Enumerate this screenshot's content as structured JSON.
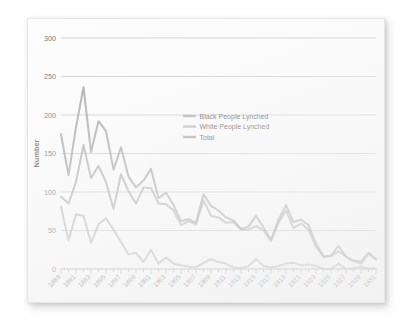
{
  "chart_data": {
    "type": "line",
    "title": "",
    "xlabel": "",
    "ylabel": "Number",
    "ylim": [
      0,
      300
    ],
    "xlim": [
      1889,
      1931
    ],
    "yticks": [
      0,
      50,
      100,
      150,
      200,
      250,
      300
    ],
    "grid": true,
    "legend_position": "center",
    "x": [
      1889,
      1890,
      1891,
      1892,
      1893,
      1894,
      1895,
      1896,
      1897,
      1898,
      1899,
      1900,
      1901,
      1902,
      1903,
      1904,
      1905,
      1906,
      1907,
      1908,
      1909,
      1910,
      1911,
      1912,
      1913,
      1914,
      1915,
      1916,
      1917,
      1918,
      1919,
      1920,
      1921,
      1922,
      1923,
      1924,
      1925,
      1926,
      1927,
      1928,
      1929,
      1930,
      1931
    ],
    "xticklabels": [
      "1889",
      "1891",
      "1893",
      "1895",
      "1897",
      "1899",
      "1901",
      "1903",
      "1905",
      "1907",
      "1909",
      "1911",
      "1913",
      "1915",
      "1917",
      "1919",
      "1921",
      "1923",
      "1925",
      "1927",
      "1929",
      "1931"
    ],
    "series": [
      {
        "name": "Black People Lynched",
        "color": "#9a9a9a",
        "values": [
          94,
          85,
          113,
          161,
          118,
          134,
          113,
          78,
          123,
          101,
          85,
          106,
          105,
          85,
          84,
          76,
          57,
          62,
          58,
          89,
          69,
          67,
          60,
          61,
          51,
          51,
          56,
          50,
          36,
          60,
          76,
          53,
          59,
          51,
          29,
          16,
          17,
          23,
          16,
          10,
          7,
          20,
          12
        ],
        "notes": "upper grey line; converges with Total after ~1905"
      },
      {
        "name": "White People Lynched",
        "color": "#a6a6a6",
        "values": [
          81,
          37,
          71,
          69,
          34,
          58,
          66,
          51,
          35,
          19,
          21,
          9,
          25,
          7,
          15,
          7,
          5,
          3,
          2,
          8,
          13,
          9,
          7,
          2,
          1,
          4,
          13,
          4,
          2,
          4,
          7,
          8,
          5,
          6,
          4,
          0,
          0,
          7,
          0,
          1,
          3,
          1,
          1
        ],
        "notes": "lower grey line near baseline after ~1905"
      },
      {
        "name": "Total",
        "color": "#8e8e8e",
        "values": [
          175,
          122,
          184,
          236,
          152,
          192,
          179,
          129,
          158,
          120,
          106,
          115,
          130,
          92,
          99,
          83,
          62,
          65,
          60,
          97,
          82,
          76,
          67,
          63,
          52,
          55,
          69,
          54,
          38,
          64,
          83,
          61,
          64,
          57,
          33,
          16,
          17,
          30,
          16,
          11,
          10,
          21,
          13
        ],
        "notes": "topmost grey line"
      }
    ]
  },
  "chart": {
    "ylabel": "Number",
    "legend": [
      {
        "label": "Black People Lynched"
      },
      {
        "label": "White People Lynched"
      },
      {
        "label": "Total"
      }
    ]
  }
}
